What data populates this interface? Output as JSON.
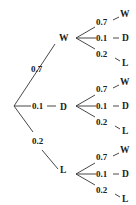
{
  "diagram": {
    "type": "probability-tree",
    "root": {
      "branches": [
        {
          "prob": "0.7",
          "outcome": "W",
          "branches": [
            {
              "prob": "0.7",
              "outcome": "W"
            },
            {
              "prob": "0.1",
              "outcome": "D"
            },
            {
              "prob": "0.2",
              "outcome": "L"
            }
          ]
        },
        {
          "prob": "0.1",
          "outcome": "D",
          "branches": [
            {
              "prob": "0.7",
              "outcome": "W"
            },
            {
              "prob": "0.1",
              "outcome": "D"
            },
            {
              "prob": "0.2",
              "outcome": "L"
            }
          ]
        },
        {
          "prob": "0.2",
          "outcome": "L",
          "branches": [
            {
              "prob": "0.7",
              "outcome": "W"
            },
            {
              "prob": "0.1",
              "outcome": "D"
            },
            {
              "prob": "0.2",
              "outcome": "L"
            }
          ]
        }
      ]
    }
  }
}
